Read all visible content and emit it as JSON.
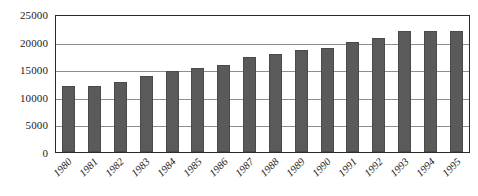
{
  "chart_data": {
    "type": "bar",
    "title": "",
    "subtitle": "",
    "xlabel": "",
    "ylabel": "",
    "categories": [
      "1980",
      "1981",
      "1982",
      "1983",
      "1984",
      "1985",
      "1986",
      "1987",
      "1988",
      "1989",
      "1990",
      "1991",
      "1992",
      "1993",
      "1994",
      "1995"
    ],
    "values": [
      12000,
      12000,
      12700,
      13800,
      14700,
      15300,
      15800,
      17200,
      17700,
      18400,
      18800,
      19900,
      20700,
      21900,
      22000,
      22000
    ],
    "series": [
      {
        "name": "",
        "values": [
          12000,
          12000,
          12700,
          13800,
          14700,
          15300,
          15800,
          17200,
          17700,
          18400,
          18800,
          19900,
          20700,
          21900,
          22000,
          22000
        ]
      }
    ],
    "ylim": [
      0,
      25000
    ],
    "y_ticks": [
      0,
      5000,
      10000,
      15000,
      20000,
      25000
    ],
    "y_tick_labels": [
      "0",
      "5000",
      "10000",
      "15000",
      "20000",
      "25000"
    ],
    "grid": "horizontal",
    "legend": "none",
    "bar_color": "#5a5a5a",
    "grid_color": "#8d8d8d",
    "axis_color": "#2b2b2b",
    "text_color": "#1a1a1a",
    "x_tick_rotation": "-45"
  }
}
